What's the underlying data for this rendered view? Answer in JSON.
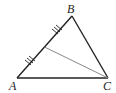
{
  "diagram": {
    "type": "triangle-with-median",
    "vertices": {
      "A": {
        "label": "A",
        "x": 17,
        "y": 78
      },
      "B": {
        "label": "B",
        "x": 72,
        "y": 16
      },
      "C": {
        "label": "C",
        "x": 108,
        "y": 78
      }
    },
    "midpoint_AB": {
      "x": 44.5,
      "y": 47
    },
    "segments": [
      {
        "from": "A",
        "to": "B",
        "color": "#222222"
      },
      {
        "from": "B",
        "to": "C",
        "color": "#222222"
      },
      {
        "from": "A",
        "to": "C",
        "color": "#222222"
      },
      {
        "from": "M",
        "to": "C",
        "color": "#888888",
        "note": "median from C to midpoint of AB"
      }
    ],
    "tick_marks": {
      "count_per_half": 3,
      "segments": [
        "AM",
        "MB"
      ]
    },
    "colors": {
      "stroke": "#222222",
      "median": "#888888",
      "background": "#ffffff"
    }
  }
}
